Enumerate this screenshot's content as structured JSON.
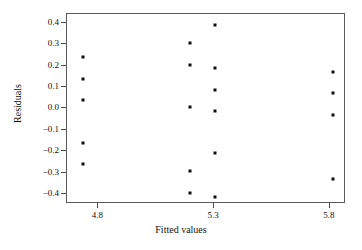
{
  "chart_data": {
    "type": "scatter",
    "title": "",
    "xlabel": "Fitted values",
    "ylabel": "Residuals",
    "xlim": [
      4.665,
      5.87
    ],
    "ylim": [
      -0.445,
      0.44
    ],
    "xticks": [
      4.8,
      5.3,
      5.8
    ],
    "xticklabels": [
      "4.8",
      "5.3",
      "5.8"
    ],
    "yticks": [
      0.4,
      0.3,
      0.2,
      0.1,
      0.0,
      -0.1,
      -0.2,
      -0.3,
      -0.4
    ],
    "yticklabels": [
      "0.4",
      "0.3",
      "0.2",
      "0.1",
      "0.0",
      "−0.1",
      "−0.2",
      "−0.3",
      "−0.4"
    ],
    "grid": false,
    "legend": null,
    "marker": "square",
    "marker_color": "#0d0d0d",
    "marker_size": 3,
    "frame_color": "#5a5a5a",
    "background": "#ffffff",
    "n_points": 20,
    "points": [
      {
        "x": 4.74,
        "y": 0.235
      },
      {
        "x": 4.74,
        "y": 0.133
      },
      {
        "x": 4.74,
        "y": 0.035
      },
      {
        "x": 4.74,
        "y": -0.165
      },
      {
        "x": 4.74,
        "y": -0.265
      },
      {
        "x": 5.2,
        "y": 0.3
      },
      {
        "x": 5.2,
        "y": 0.2
      },
      {
        "x": 5.2,
        "y": 0.003
      },
      {
        "x": 5.2,
        "y": -0.298
      },
      {
        "x": 5.2,
        "y": -0.4
      },
      {
        "x": 5.31,
        "y": 0.383
      },
      {
        "x": 5.31,
        "y": 0.182
      },
      {
        "x": 5.31,
        "y": 0.083
      },
      {
        "x": 5.31,
        "y": -0.015
      },
      {
        "x": 5.31,
        "y": -0.213
      },
      {
        "x": 5.31,
        "y": -0.418
      },
      {
        "x": 5.82,
        "y": 0.167
      },
      {
        "x": 5.82,
        "y": 0.068
      },
      {
        "x": 5.82,
        "y": -0.033
      },
      {
        "x": 5.82,
        "y": -0.332
      }
    ]
  }
}
